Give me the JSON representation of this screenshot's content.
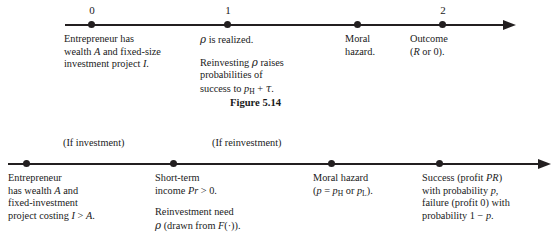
{
  "figure": {
    "caption": "Figure 5.14",
    "top_timeline": {
      "name": "three-date-timeline",
      "tick_labels": [
        "0",
        "1",
        "2"
      ],
      "nodes": [
        {
          "tick": "0",
          "lines": [
            [
              "Entrepreneur has",
              "wealth A and fixed-size",
              "investment project I."
            ]
          ]
        },
        {
          "tick": "1",
          "lines": [
            [
              "ρ is realized."
            ],
            [
              "Reinvesting ρ raises",
              "probabilities of",
              "success to pH + τ."
            ]
          ]
        },
        {
          "tick": "",
          "lines": [
            [
              "Moral",
              "hazard."
            ]
          ]
        },
        {
          "tick": "2",
          "lines": [
            [
              "Outcome",
              "(R or 0)."
            ]
          ]
        }
      ]
    },
    "bottom_timeline": {
      "name": "four-node-timeline",
      "branch_labels": [
        "(If investment)",
        "(If reinvestment)"
      ],
      "nodes": [
        {
          "lines": [
            [
              "Entrepreneur",
              "has wealth A and",
              "fixed-investment",
              "project costing I > A."
            ]
          ]
        },
        {
          "lines": [
            [
              "Short-term",
              "income Pr > 0."
            ],
            [
              "Reinvestment need",
              "ρ (drawn from F(·))."
            ]
          ]
        },
        {
          "lines": [
            [
              "Moral hazard",
              "(p = pH or pL)."
            ]
          ]
        },
        {
          "lines": [
            [
              "Success (profit PR)",
              "with probability p,",
              "failure (profit 0) with",
              "probability 1 − p."
            ]
          ]
        }
      ]
    }
  },
  "colors": {
    "ink": "#231f20",
    "background": "#ffffff"
  }
}
